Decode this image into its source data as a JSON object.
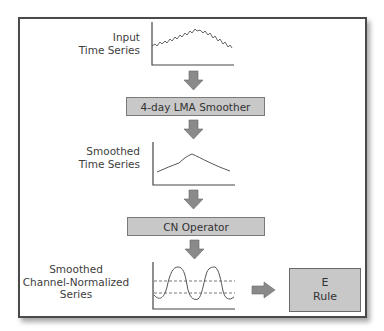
{
  "diagram": {
    "steps": [
      {
        "id": "input",
        "label_lines": [
          "Input",
          "Time Series"
        ],
        "plot": "jagged-hump"
      },
      {
        "id": "lma",
        "box_label": "4-day LMA Smoother"
      },
      {
        "id": "smoothed",
        "label_lines": [
          "Smoothed",
          "Time Series"
        ],
        "plot": "smooth-hump"
      },
      {
        "id": "cn",
        "box_label": "CN Operator"
      },
      {
        "id": "cn_series",
        "label_lines": [
          "Smoothed",
          "Channel-Normalized",
          "Series"
        ],
        "plot": "oscillation-with-channel-bands"
      }
    ],
    "rule_box": {
      "line1": "E",
      "line2": "Rule"
    }
  },
  "colors": {
    "frame_border": "#4a4a4a",
    "box_fill": "#c8c8c8",
    "arrow_fill": "#8a8a8a",
    "line": "#444444"
  }
}
